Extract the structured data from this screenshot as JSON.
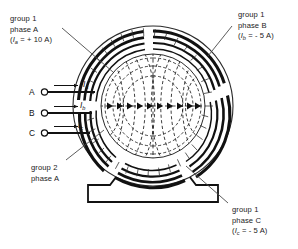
{
  "figure": {
    "kind": "three-phase-machine-cross-section"
  },
  "callouts": {
    "top_left": {
      "line1": "group 1",
      "line2": "phase A",
      "current_open": "(",
      "current_symbol": "I",
      "current_subscript": "a",
      "current_value": " = + 10 A)",
      "full": "(Ia = + 10 A)"
    },
    "top_right": {
      "line1": "group 1",
      "line2": "phase B",
      "current_open": "(",
      "current_symbol": "I",
      "current_subscript": "b",
      "current_value": " = - 5 A)",
      "full": "(Ib = - 5 A)"
    },
    "bottom_left": {
      "line1": "group 2",
      "line2": "phase A"
    },
    "bottom_right": {
      "line1": "group 1",
      "line2": "phase C",
      "current_open": "(",
      "current_symbol": "I",
      "current_subscript": "c",
      "current_value": " = - 5 A)",
      "full": "(Ic = - 5 A)"
    }
  },
  "terminals": [
    {
      "name": "A",
      "current_symbol": "I",
      "current_subscript": "a"
    },
    {
      "name": "B",
      "current_symbol": "I",
      "current_subscript": "b"
    },
    {
      "name": "C",
      "current_symbol": "I",
      "current_subscript": "c"
    }
  ],
  "colors": {
    "ink": "#111111",
    "background": "#ffffff",
    "line": "#1a1a1a"
  }
}
